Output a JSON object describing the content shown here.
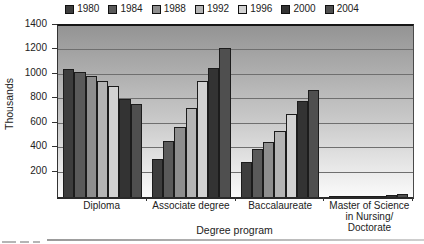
{
  "figure": {
    "y_axis_title": "Thousands",
    "x_axis_title": "Degree program"
  },
  "chart_data": {
    "type": "bar",
    "title": "",
    "xlabel": "Degree program",
    "ylabel": "Thousands",
    "ylim": [
      0,
      1400
    ],
    "yticks": [
      200,
      400,
      600,
      800,
      1000,
      1200,
      1400
    ],
    "grid": true,
    "legend_position": "top",
    "plot_background": "vertical gradient, dark gray top to white bottom",
    "categories": [
      "Diploma",
      "Associate degree",
      "Baccalaureate",
      "Master of Science in Nursing/Doctorate"
    ],
    "category_label_lines": [
      [
        "Diploma"
      ],
      [
        "Associate degree"
      ],
      [
        "Baccalaureate"
      ],
      [
        "Master of Science",
        "in Nursing/",
        "Doctorate"
      ]
    ],
    "series": [
      {
        "name": "1980",
        "color": "#3d3d3d",
        "values": [
          1050,
          310,
          290,
          3
        ]
      },
      {
        "name": "1984",
        "color": "#5a5a5a",
        "values": [
          1020,
          460,
          390,
          5
        ]
      },
      {
        "name": "1988",
        "color": "#8e8e8e",
        "values": [
          990,
          570,
          450,
          7
        ]
      },
      {
        "name": "1992",
        "color": "#b4b4b4",
        "values": [
          950,
          730,
          540,
          9
        ]
      },
      {
        "name": "1996",
        "color": "#d2d2d2",
        "values": [
          910,
          950,
          680,
          12
        ]
      },
      {
        "name": "2000",
        "color": "#333333",
        "values": [
          800,
          1060,
          790,
          16
        ]
      },
      {
        "name": "2004",
        "color": "#4f4f4f",
        "values": [
          760,
          1220,
          880,
          25
        ]
      }
    ]
  },
  "colors": {
    "grid_line": "#6f6f6f",
    "axis_line": "#333333",
    "bar_border": "#1c1c1c",
    "plot_gradient_top": "#949494",
    "plot_gradient_bottom": "#fbfbfb"
  }
}
